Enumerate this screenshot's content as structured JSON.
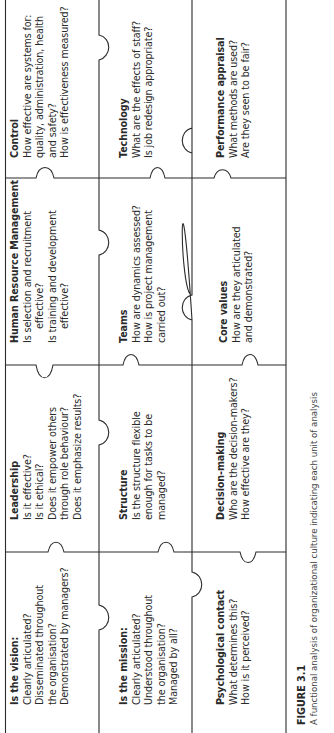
{
  "figure": {
    "label": "FIGURE 3.1",
    "caption": "A functional analysis of organizational culture indicating each unit of analysis"
  },
  "grid": {
    "rows": [
      {
        "cells": [
          {
            "title": "Is the vision:",
            "lines": [
              "Clearly articulated?",
              "Disseminated throughout",
              "the organisation?",
              "Demonstrated by managers?"
            ]
          },
          {
            "title": "Leadership",
            "lines": [
              "Is it effective?",
              "Is it ethical?",
              "Does it empower others",
              "through role behaviour?",
              "Does it emphasize results?"
            ]
          },
          {
            "title": "Human Resource Management",
            "lines": [
              "Is selection and recruitment",
              "effective?",
              "Is training and development",
              "effective?"
            ]
          },
          {
            "title": "Control",
            "lines": [
              "How effective are systems for:",
              "quality, administration, health",
              "and safety?",
              "How is effectiveness measured?"
            ]
          }
        ]
      },
      {
        "cells": [
          {
            "title": "Is the mission:",
            "lines": [
              "Clearly articulated?",
              "Understood throughout",
              "the organisation?",
              "Managed by all?"
            ]
          },
          {
            "title": "Structure",
            "lines": [
              "Is the structure flexible",
              "enough for tasks to be",
              "managed?"
            ]
          },
          {
            "title": "Teams",
            "lines": [
              "How are dynamics assessed?",
              "How is project management",
              "carried out?"
            ]
          },
          {
            "title": "Technology",
            "lines": [
              "What are the effects of staff?",
              "Is job redesign appropriate?"
            ]
          }
        ]
      },
      {
        "cells": [
          {
            "title": "Psychological contact",
            "lines": [
              "What determines this?",
              "How is it perceived?"
            ]
          },
          {
            "title": "Decision-making",
            "lines": [
              "Who are the decision-makers?",
              "How effective are they?"
            ]
          },
          {
            "title": "Core values",
            "lines": [
              "How are they articulated",
              "and demonstrated?"
            ]
          },
          {
            "title": "Performance appraisal",
            "lines": [
              "What methods are used?",
              "Are they seen to be fair?"
            ]
          }
        ]
      }
    ]
  },
  "colors": {
    "line": "#2b2b2b",
    "text": "#2a2a2a",
    "background": "#ffffff"
  }
}
